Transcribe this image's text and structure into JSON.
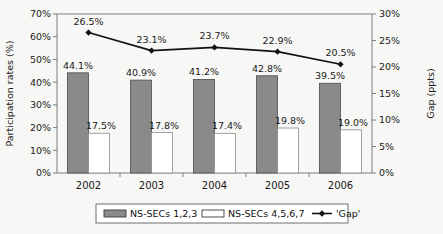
{
  "chart_data": {
    "type": "bar",
    "title": "",
    "categories": [
      "2002",
      "2003",
      "2004",
      "2005",
      "2006"
    ],
    "xlabel": "",
    "ylabel": "Participation rates (%)",
    "y2label": "Gap (ppts)",
    "ylim": [
      0,
      70
    ],
    "y2lim": [
      0,
      30
    ],
    "ytick_labels": [
      "0%",
      "10%",
      "20%",
      "30%",
      "40%",
      "50%",
      "60%",
      "70%"
    ],
    "ytick_values": [
      0,
      10,
      20,
      30,
      40,
      50,
      60,
      70
    ],
    "y2tick_labels": [
      "0%",
      "5%",
      "10%",
      "15%",
      "20%",
      "25%",
      "30%"
    ],
    "y2tick_values": [
      0,
      5,
      10,
      15,
      20,
      25,
      30
    ],
    "grid": false,
    "legend_position": "bottom",
    "series": [
      {
        "name": "NS-SECs 1,2,3",
        "kind": "bar",
        "axis": "left",
        "color": "#8a8a8a",
        "values": [
          44.1,
          40.9,
          41.2,
          42.8,
          39.5
        ],
        "labels": [
          "44.1%",
          "40.9%",
          "41.2%",
          "42.8%",
          "39.5%"
        ]
      },
      {
        "name": "NS-SECs 4,5,6,7",
        "kind": "bar",
        "axis": "left",
        "color": "#ffffff",
        "values": [
          17.5,
          17.8,
          17.4,
          19.8,
          19.0
        ],
        "labels": [
          "17.5%",
          "17.8%",
          "17.4%",
          "19.8%",
          "19.0%"
        ]
      },
      {
        "name": "'Gap'",
        "kind": "line",
        "axis": "right",
        "color": "#111111",
        "values": [
          26.5,
          23.1,
          23.7,
          22.9,
          20.5
        ],
        "labels": [
          "26.5%",
          "23.1%",
          "23.7%",
          "22.9%",
          "20.5%"
        ]
      }
    ]
  }
}
